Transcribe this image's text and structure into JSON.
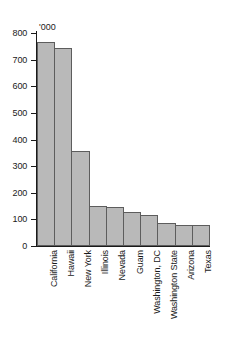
{
  "chart_data": {
    "type": "bar",
    "title": "",
    "subtitle": "",
    "xlabel": "",
    "ylabel": "'000",
    "unit_label": "'000",
    "categories": [
      "California",
      "Hawaii",
      "New York",
      "Illinois",
      "Nevada",
      "Guam",
      "Washington, DC",
      "Washington State",
      "Arizona",
      "Texas"
    ],
    "values": [
      768,
      742,
      355,
      150,
      147,
      128,
      118,
      88,
      80,
      80
    ],
    "ylim": [
      0,
      800
    ],
    "yticks": [
      0,
      100,
      200,
      300,
      400,
      500,
      600,
      700,
      800
    ],
    "ytick_labels": [
      "0",
      "100",
      "200",
      "300",
      "400",
      "500",
      "600",
      "700",
      "800"
    ],
    "grid": false,
    "legend": false,
    "legend_position": "none",
    "orientation": "vertical",
    "bar_fill_color": "#b9b9b9",
    "bar_edge_color": "#5d5d5d",
    "axis_color": "#1a1a1a",
    "background_color": "#ffffff"
  }
}
